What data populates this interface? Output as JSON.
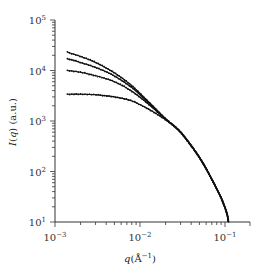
{
  "chart_data": {
    "type": "line",
    "title": "",
    "xlabel": "q(Å^-1)",
    "ylabel": "I(q) (a.u.)",
    "xscale": "log",
    "yscale": "log",
    "xlim": [
      0.001,
      0.2
    ],
    "ylim": [
      10,
      100000
    ],
    "x_ticks": [
      {
        "value": 0.001,
        "label": "10",
        "exp": "-3"
      },
      {
        "value": 0.01,
        "label": "10",
        "exp": "-2"
      },
      {
        "value": 0.1,
        "label": "10",
        "exp": "-1"
      }
    ],
    "y_ticks": [
      {
        "value": 10,
        "label": "10",
        "exp": "1"
      },
      {
        "value": 100,
        "label": "10",
        "exp": "2"
      },
      {
        "value": 1000,
        "label": "10",
        "exp": "3"
      },
      {
        "value": 10000,
        "label": "10",
        "exp": "4"
      },
      {
        "value": 100000,
        "label": "10",
        "exp": "5"
      }
    ],
    "grid": false,
    "legend": null,
    "markers": "small dots (data) with solid fit lines",
    "series": [
      {
        "name": "curve 1",
        "x": [
          0.0014,
          0.002,
          0.003,
          0.005,
          0.008,
          0.012,
          0.02,
          0.03,
          0.05,
          0.07,
          0.09,
          0.105,
          0.11
        ],
        "y": [
          23000,
          19000,
          14500,
          9000,
          5000,
          2600,
          1100,
          600,
          190,
          70,
          30,
          15,
          10
        ]
      },
      {
        "name": "curve 2",
        "x": [
          0.0014,
          0.002,
          0.003,
          0.005,
          0.008,
          0.012,
          0.02,
          0.03,
          0.05,
          0.07,
          0.09,
          0.105,
          0.11
        ],
        "y": [
          17000,
          14500,
          11500,
          7800,
          4600,
          2500,
          1100,
          600,
          190,
          70,
          30,
          15,
          10
        ]
      },
      {
        "name": "curve 3",
        "x": [
          0.0014,
          0.002,
          0.003,
          0.005,
          0.008,
          0.012,
          0.02,
          0.03,
          0.05,
          0.07,
          0.09,
          0.105,
          0.11
        ],
        "y": [
          10000,
          9200,
          7900,
          6000,
          3900,
          2300,
          1100,
          600,
          190,
          70,
          30,
          15,
          10
        ]
      },
      {
        "name": "curve 4",
        "x": [
          0.0014,
          0.002,
          0.003,
          0.005,
          0.008,
          0.012,
          0.02,
          0.03,
          0.05,
          0.07,
          0.09,
          0.105,
          0.11
        ],
        "y": [
          3400,
          3400,
          3300,
          3000,
          2500,
          1800,
          1050,
          600,
          190,
          70,
          30,
          15,
          10
        ]
      }
    ]
  }
}
